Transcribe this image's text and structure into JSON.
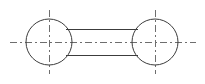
{
  "drawing": {
    "title": "Two-circle link engineering outline",
    "type": "technical-line-drawing",
    "canvas": {
      "width": 205,
      "height": 84,
      "background": "#ffffff"
    },
    "style": {
      "outline_color": "#3c3c3c",
      "outline_width": 1,
      "centerline_color": "#6e6e6e",
      "centerline_width": 1,
      "centerline_dash": "7 3 2 3"
    },
    "shapes": {
      "left_circle": {
        "name": "left-boss-circle",
        "cx": 49,
        "cy": 42,
        "r": 23
      },
      "right_circle": {
        "name": "right-boss-circle",
        "cx": 155,
        "cy": 42,
        "r": 23
      },
      "connecting_bar": {
        "name": "connecting-bar",
        "x1": 66,
        "x2": 138,
        "top_y": 29,
        "bottom_y": 55
      }
    },
    "centerlines": {
      "horizontal_axis": {
        "x1": 10,
        "x2": 196,
        "y": 42
      },
      "left_vertical": {
        "x": 49,
        "y1": 10,
        "y2": 74
      },
      "right_vertical": {
        "x": 155,
        "y1": 10,
        "y2": 74
      }
    }
  }
}
